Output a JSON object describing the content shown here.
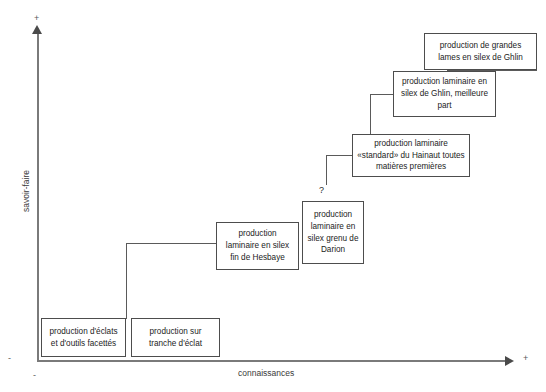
{
  "axes": {
    "y_label": "savoir-faire",
    "x_label": "connaissances",
    "sign_top": "+",
    "sign_right": "+",
    "sign_left": "-",
    "sign_origin": "-"
  },
  "annotations": {
    "uncertainty_marker": "?"
  },
  "nodes": [
    {
      "id": "box-grandes-lames",
      "text": "production de grandes lames en silex de Ghlin"
    },
    {
      "id": "box-ghlin-meilleure",
      "text": "production laminaire en silex de Ghlin, meilleure part"
    },
    {
      "id": "box-hainaut-standard",
      "text": "production laminaire «standard» du Hainaut toutes matières premières"
    },
    {
      "id": "box-darion",
      "text": "production laminaire en silex grenu de Darion"
    },
    {
      "id": "box-hesbaye",
      "text": "production laminaire en silex fin de Hesbaye"
    },
    {
      "id": "box-eclats",
      "text": "production d'éclats et d'outils facettés"
    },
    {
      "id": "box-tranche",
      "text": "production sur tranche d'éclat"
    }
  ],
  "colors": {
    "box_border": "#4d4d4d",
    "connector": "#5a5a5a",
    "axis": "#7a7a7a",
    "text": "#1c1c1c"
  }
}
